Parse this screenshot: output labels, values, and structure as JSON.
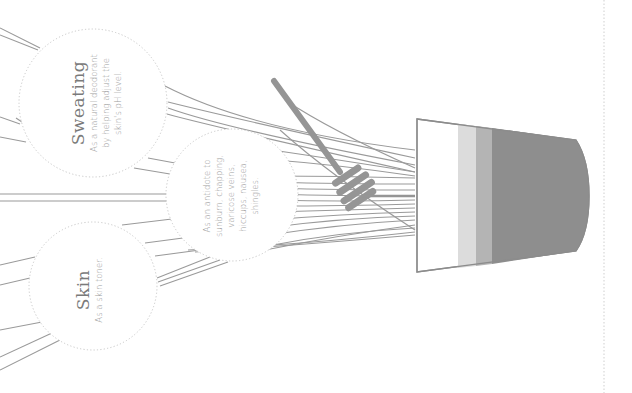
{
  "infographic": {
    "subject": "honey-uses",
    "orientation": "rotated-90",
    "colors": {
      "line": "#9a9a9a",
      "circle_border": "#c8c8c8",
      "jar_outline": "#8c8c8c",
      "band_light": "#dcdcdc",
      "band_mid": "#b4b4b4",
      "honey": "#8e8e8e",
      "dipper": "#959595",
      "text_title": "#7a7a7a",
      "text_body": "#9a9a9a"
    },
    "bubbles": [
      {
        "title": "Sweating",
        "lines": [
          "As a natural deodorant",
          "by helping adjust the",
          "skin's pH level."
        ]
      },
      {
        "title": "Skin",
        "lines": [
          "As a skin toner."
        ]
      },
      {
        "title": "",
        "lines": [
          "As an antidote to",
          "sunburn, chapping,",
          "varicose veins,",
          "hiccups, nausea,",
          "shingles."
        ]
      }
    ]
  }
}
